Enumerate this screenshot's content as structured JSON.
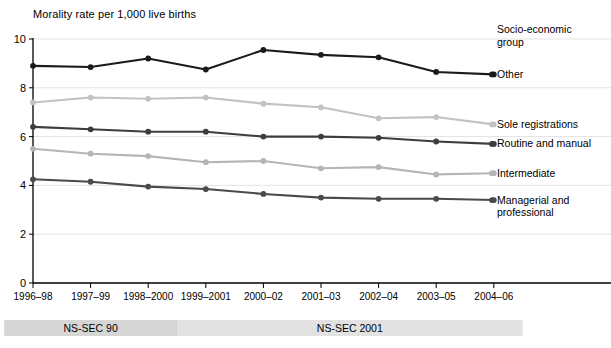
{
  "chart_data": {
    "type": "line",
    "title": "Morality rate per 1,000 live births",
    "xlabel": "",
    "ylabel": "",
    "ylim": [
      0,
      10
    ],
    "yticks": [
      "0",
      "2",
      "4",
      "6",
      "8",
      "10"
    ],
    "grid": true,
    "legend_position": "right",
    "legend_title": "Socio-economic\ngroup",
    "legend_title_line1": "Socio-economic",
    "legend_title_line2": "group",
    "categories": [
      "1996–98",
      "1997–99",
      "1998–2000",
      "1999–2001",
      "2000–02",
      "2001–03",
      "2002–04",
      "2003–05",
      "2004–06"
    ],
    "series": [
      {
        "name": "Other",
        "color": "#1a1a1a",
        "values": [
          8.9,
          8.85,
          9.2,
          8.75,
          9.55,
          9.35,
          9.25,
          8.65,
          8.55
        ]
      },
      {
        "name": "Sole registrations",
        "color": "#c2c2c2",
        "values": [
          7.4,
          7.6,
          7.55,
          7.6,
          7.35,
          7.2,
          6.75,
          6.8,
          6.5
        ]
      },
      {
        "name": "Routine and manual",
        "color": "#3d3d3d",
        "values": [
          6.4,
          6.3,
          6.2,
          6.2,
          6.0,
          6.0,
          5.95,
          5.8,
          5.7
        ]
      },
      {
        "name": "Intermediate",
        "color": "#b5b5b5",
        "values": [
          5.5,
          5.3,
          5.2,
          4.95,
          5.0,
          4.7,
          4.75,
          4.45,
          4.5
        ]
      },
      {
        "name": "Managerial and professional",
        "color": "#4a4a4a",
        "values": [
          4.25,
          4.15,
          3.95,
          3.85,
          3.65,
          3.5,
          3.45,
          3.45,
          3.4
        ]
      }
    ],
    "series_labels": [
      {
        "name": "Other",
        "line1": "Other",
        "line2": ""
      },
      {
        "name": "Sole registrations",
        "line1": "Sole registrations",
        "line2": ""
      },
      {
        "name": "Routine and manual",
        "line1": "Routine and manual",
        "line2": ""
      },
      {
        "name": "Intermediate",
        "line1": "Intermediate",
        "line2": ""
      },
      {
        "name": "Managerial and professional",
        "line1": "Managerial and",
        "line2": "professional"
      }
    ],
    "period_bands": [
      {
        "label": "NS-SEC 90",
        "start_category": "1996–98",
        "end_category": "1998–2000",
        "color": "#d6d6d6"
      },
      {
        "label": "NS-SEC 2001",
        "start_category": "1999–2001",
        "end_category": "2004–06",
        "color": "#e2e2e2"
      }
    ]
  }
}
